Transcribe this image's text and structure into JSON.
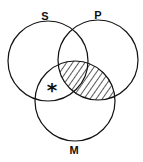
{
  "diagram": {
    "type": "venn",
    "circles": [
      {
        "id": "S",
        "label": "S",
        "cx": 48,
        "cy": 61,
        "r": 40,
        "label_x": 45,
        "label_y": 20
      },
      {
        "id": "P",
        "label": "P",
        "cx": 98,
        "cy": 60,
        "r": 40,
        "label_x": 98,
        "label_y": 19
      },
      {
        "id": "M",
        "label": "M",
        "cx": 75,
        "cy": 101,
        "r": 40,
        "label_x": 74,
        "label_y": 154
      }
    ],
    "shaded_region": "P ∩ M",
    "marked_region": "S ∩ M (outside P)",
    "mark": {
      "symbol": "*",
      "x": 52,
      "y": 96
    },
    "stroke_color": "#111111",
    "background": "#ffffff"
  }
}
